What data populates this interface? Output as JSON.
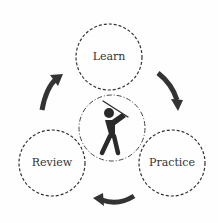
{
  "diagram": {
    "type": "cycle",
    "center_icon": "golfer-icon",
    "nodes": [
      {
        "id": "learn",
        "label": "Learn"
      },
      {
        "id": "practice",
        "label": "Practice"
      },
      {
        "id": "review",
        "label": "Review"
      }
    ],
    "edges": [
      {
        "from": "learn",
        "to": "practice"
      },
      {
        "from": "practice",
        "to": "review"
      },
      {
        "from": "review",
        "to": "learn"
      }
    ]
  }
}
